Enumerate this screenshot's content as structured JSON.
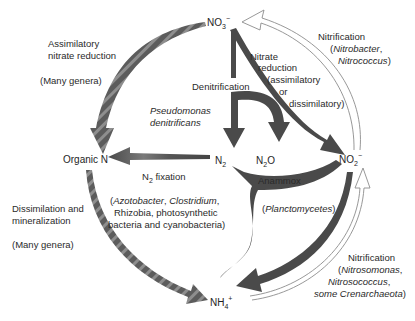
{
  "colors": {
    "background": "#ffffff",
    "arrow_dark": "#4a4a4a",
    "arrow_striped_a": "#5a5a5a",
    "arrow_striped_b": "#8a8a8a",
    "arrow_outline": "#8c8c8c",
    "text": "#2a2a2a"
  },
  "nodes": {
    "no3": {
      "base": "NO",
      "sub": "3",
      "sup": "−"
    },
    "no2": {
      "base": "NO",
      "sub": "2",
      "sup": "−"
    },
    "n2": {
      "base": "N",
      "sub": "2"
    },
    "n2o": {
      "base": "N",
      "sub": "2",
      "tail": "O"
    },
    "organic_n": {
      "label": "Organic N"
    },
    "nh4": {
      "base": "NH",
      "sub": "4",
      "sup": "+"
    }
  },
  "processes": {
    "assimilatory_nitrate_reduction": {
      "line1": "Assimilatory",
      "line2": "nitrate reduction",
      "organisms": "(Many genera)"
    },
    "denitrification": {
      "label": "Denitrification",
      "organism_line1": "Pseudomonas",
      "organism_line2": "denitrificans"
    },
    "nitrate_reduction": {
      "line1": "Nitrate",
      "line2": "reduction",
      "line3": "(assimilatory",
      "line4": "or",
      "line5": "dissimilatory)"
    },
    "nitrification_top": {
      "label": "Nitrification",
      "org1_open": "(",
      "org1": "Nitrobacter",
      "org1_close": ",",
      "org2": "Nitrococcus",
      "org2_close": ")"
    },
    "n2_fixation": {
      "base": "N",
      "sub": "2",
      "label": " fixation",
      "org_line1_a": "(",
      "org_line1_b": "Azotobacter",
      "org_line1_c": ", ",
      "org_line1_d": "Clostridium",
      "org_line1_e": ",",
      "org_line2": "Rhizobia, photosynthetic",
      "org_line3": "bacteria and cyanobacteria)"
    },
    "anammox": {
      "label": "Anammox",
      "org_open": "(",
      "org": "Planctomycetes",
      "org_close": ")"
    },
    "dissimilation": {
      "line1": "Dissimilation and",
      "line2": "mineralization",
      "organisms": "(Many genera)"
    },
    "nitrification_bottom": {
      "label": "Nitrification",
      "org1_open": "(",
      "org1": "Nitrosomonas",
      "org1_close": ",",
      "org2": "Nitrosococcus",
      "org2_close": ",",
      "org3": "some Crenarchaeota",
      "org3_close": ")"
    }
  }
}
